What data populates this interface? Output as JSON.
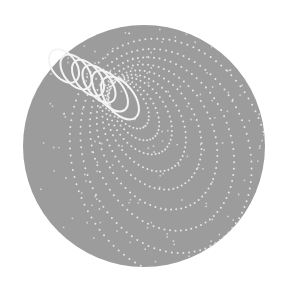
{
  "illustration": {
    "title": "Helical spring spiraling into dotted loops on a sphere",
    "canvas": {
      "width": 282,
      "height": 295
    },
    "colors": {
      "background": "#ffffff",
      "sphere": "#9c9c9c",
      "sphere_edge": "#959595",
      "spring": "#f4f4f4",
      "dots": "#e6e6e6"
    },
    "sphere": {
      "cx": 144,
      "cy": 146,
      "r": 121
    },
    "spring": {
      "solid_coils": [
        {
          "cx": 64,
          "cy": 66,
          "rx": 12,
          "ry": 19,
          "rot": -38
        },
        {
          "cx": 76,
          "cy": 72,
          "rx": 12,
          "ry": 20,
          "rot": -38
        },
        {
          "cx": 88,
          "cy": 78,
          "rx": 12,
          "ry": 21,
          "rot": -38
        },
        {
          "cx": 99,
          "cy": 84,
          "rx": 12,
          "ry": 22,
          "rot": -38
        },
        {
          "cx": 110,
          "cy": 91,
          "rx": 13,
          "ry": 24,
          "rot": -38
        },
        {
          "cx": 120,
          "cy": 98,
          "rx": 14,
          "ry": 25,
          "rot": -38
        }
      ],
      "dotted_loops": [
        {
          "cx": 128,
          "cy": 104,
          "rx": 16,
          "ry": 28,
          "rot": -36,
          "dots": 34
        },
        {
          "cx": 134,
          "cy": 110,
          "rx": 20,
          "ry": 34,
          "rot": -34,
          "dots": 40
        },
        {
          "cx": 140,
          "cy": 116,
          "rx": 27,
          "ry": 42,
          "rot": -32,
          "dots": 48
        },
        {
          "cx": 146,
          "cy": 123,
          "rx": 35,
          "ry": 52,
          "rot": -30,
          "dots": 56
        },
        {
          "cx": 152,
          "cy": 130,
          "rx": 45,
          "ry": 63,
          "rot": -28,
          "dots": 64
        },
        {
          "cx": 157,
          "cy": 137,
          "rx": 56,
          "ry": 76,
          "rot": -26,
          "dots": 72
        },
        {
          "cx": 162,
          "cy": 144,
          "rx": 68,
          "ry": 90,
          "rot": -24,
          "dots": 82
        },
        {
          "cx": 166,
          "cy": 151,
          "rx": 82,
          "ry": 105,
          "rot": -22,
          "dots": 92
        },
        {
          "cx": 170,
          "cy": 158,
          "rx": 97,
          "ry": 122,
          "rot": -20,
          "dots": 104
        }
      ]
    },
    "scatter_dots": {
      "count": 140,
      "seed": 7
    }
  }
}
